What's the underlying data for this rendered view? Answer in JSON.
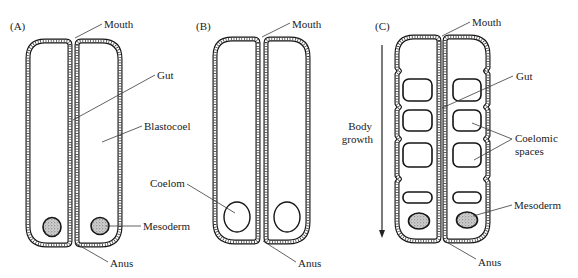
{
  "figure": {
    "width": 578,
    "height": 278,
    "colors": {
      "ink": "#151515",
      "stipple": "#c8c8c8",
      "background": "#ffffff"
    }
  },
  "panels": [
    {
      "id": "A",
      "label": "(A)",
      "annotations": {
        "mouth": "Mouth",
        "gut": "Gut",
        "blastocoel": "Blastocoel",
        "mesoderm": "Mesoderm",
        "anus": "Anus"
      }
    },
    {
      "id": "B",
      "label": "(B)",
      "annotations": {
        "mouth": "Mouth",
        "coelom": "Coelom",
        "anus": "Anus"
      }
    },
    {
      "id": "C",
      "label": "(C)",
      "annotations": {
        "mouth": "Mouth",
        "gut": "Gut",
        "coelomic_spaces_line1": "Coelomic",
        "coelomic_spaces_line2": "spaces",
        "mesoderm": "Mesoderm",
        "anus": "Anus"
      },
      "arrow": {
        "label_line1": "Body",
        "label_line2": "growth",
        "direction": "down"
      }
    }
  ]
}
